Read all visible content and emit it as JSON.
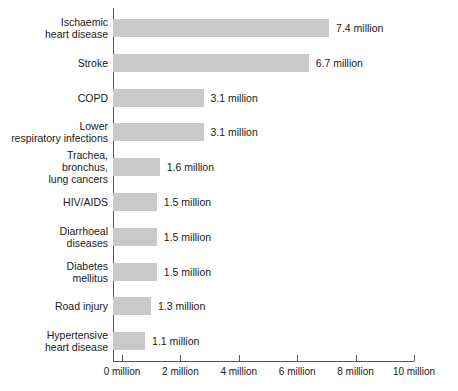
{
  "chart_data": {
    "type": "bar",
    "orientation": "horizontal",
    "title": "",
    "subtitle": "",
    "xlabel": "",
    "ylabel": "",
    "xlim": [
      0,
      10
    ],
    "grid": false,
    "legend": null,
    "bar_color": "#c9c9c9",
    "axis_color": "#555555",
    "unit_suffix": "million",
    "categories": [
      "Ischaemic\nheart disease",
      "Stroke",
      "COPD",
      "Lower\nrespiratory infections",
      "Trachea,\nbronchus,\nlung cancers",
      "HIV/AIDS",
      "Diarrhoeal\ndiseases",
      "Diabetes\nmellitus",
      "Road injury",
      "Hypertensive\nheart disease"
    ],
    "values": [
      7.4,
      6.7,
      3.1,
      3.1,
      1.6,
      1.5,
      1.5,
      1.5,
      1.3,
      1.1
    ],
    "data_labels": [
      "7.4 million",
      "6.7 million",
      "3.1 million",
      "3.1 million",
      "1.6 million",
      "1.5 million",
      "1.5 million",
      "1.5 million",
      "1.3 million",
      "1.1 million"
    ],
    "xticks": [
      0,
      2,
      4,
      6,
      8,
      10
    ],
    "xticklabels": [
      "0 million",
      "2 million",
      "4 million",
      "6 million",
      "8 million",
      "10 million"
    ]
  }
}
